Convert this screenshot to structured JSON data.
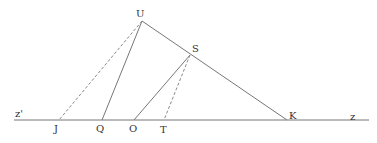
{
  "diagram": {
    "colors": {
      "solid": "#777777",
      "dashed": "#8a8a8a",
      "label": "#333333"
    },
    "baseline": {
      "x1": 14,
      "y1": 120,
      "x2": 369,
      "y2": 120
    },
    "points": {
      "U": {
        "x": 142,
        "y": 21,
        "label": "U",
        "lx": 136,
        "ly": 17
      },
      "S": {
        "x": 190,
        "y": 55,
        "label": "S",
        "lx": 192,
        "ly": 52
      },
      "K": {
        "x": 287,
        "y": 120,
        "label": "K",
        "lx": 289,
        "ly": 119
      },
      "J": {
        "x": 59,
        "y": 120,
        "label": "J",
        "lx": 54,
        "ly": 132
      },
      "Q": {
        "x": 102,
        "y": 120,
        "label": "Q",
        "lx": 96,
        "ly": 132
      },
      "O": {
        "x": 134,
        "y": 120,
        "label": "O",
        "lx": 129,
        "ly": 132
      },
      "T": {
        "x": 164,
        "y": 120,
        "label": "T",
        "lx": 160,
        "ly": 133
      }
    },
    "ray_labels": {
      "left": {
        "text": "z'",
        "x": 15,
        "y": 117
      },
      "right": {
        "text": "z",
        "x": 350,
        "y": 120
      }
    },
    "solid_segments": [
      [
        "U",
        "K"
      ],
      [
        "U",
        "Q"
      ],
      [
        "S",
        "O"
      ]
    ],
    "dashed_segments": [
      [
        "U",
        "J"
      ],
      [
        "S",
        "T"
      ]
    ]
  }
}
